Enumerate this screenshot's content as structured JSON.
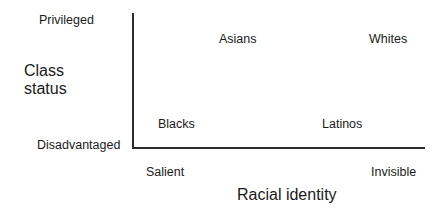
{
  "chart_data": {
    "type": "scatter",
    "title": "",
    "subtitle": "",
    "xlabel": "Racial identity",
    "ylabel": "Class status",
    "xlabel_lines": [
      "Racial identity"
    ],
    "ylabel_lines": [
      "Class",
      "status"
    ],
    "grid": false,
    "legend": "none",
    "axis_style": "open L-shaped conceptual axes, no numeric ticks",
    "x_tick_labels": [
      "Salient",
      "Invisible"
    ],
    "y_tick_labels": [
      "Disadvantaged",
      "Privileged"
    ],
    "xlim_labels": {
      "low": "Salient",
      "high": "Invisible"
    },
    "ylim_labels": {
      "low": "Disadvantaged",
      "high": "Privileged"
    },
    "x_axis_direction": "Salient (left) to Invisible (right)",
    "y_axis_direction": "Disadvantaged (bottom) to Privileged (top)",
    "points": [
      {
        "label": "Asians",
        "x": 0.33,
        "y": 0.86,
        "quadrant": "privileged / salient"
      },
      {
        "label": "Whites",
        "x": 0.85,
        "y": 0.86,
        "quadrant": "privileged / invisible"
      },
      {
        "label": "Blacks",
        "x": 0.15,
        "y": 0.22,
        "quadrant": "disadvantaged / salient"
      },
      {
        "label": "Latinos",
        "x": 0.69,
        "y": 0.22,
        "quadrant": "disadvantaged / invisible"
      }
    ],
    "colors": {
      "axis": "#2b2b2b",
      "text": "#1a1a1a",
      "background": "#ffffff"
    }
  },
  "axes": {
    "y": {
      "title_line1": "Class",
      "title_line2": "status",
      "top_label": "Privileged",
      "bottom_label": "Disadvantaged"
    },
    "x": {
      "title": "Racial identity",
      "left_label": "Salient",
      "right_label": "Invisible"
    }
  },
  "points": {
    "asians": "Asians",
    "whites": "Whites",
    "blacks": "Blacks",
    "latinos": "Latinos"
  }
}
